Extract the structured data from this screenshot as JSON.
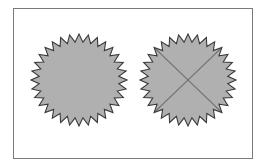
{
  "frame": {
    "border_color": "#7a7a7a",
    "background": "#ffffff"
  },
  "shapes": [
    {
      "id": "starburst-plain",
      "cx": 79,
      "cy": 80,
      "rx_outer": 48,
      "ry_outer": 46,
      "rx_inner": 40,
      "ry_inner": 38,
      "points": 32,
      "fill": "#b0b0b0",
      "stroke": "#3a3a3a",
      "cross": false
    },
    {
      "id": "starburst-crossed",
      "cx": 188,
      "cy": 80,
      "rx_outer": 48,
      "ry_outer": 46,
      "rx_inner": 40,
      "ry_inner": 38,
      "points": 32,
      "fill": "#b0b0b0",
      "stroke": "#3a3a3a",
      "cross": true,
      "cross_color": "#707070"
    }
  ]
}
